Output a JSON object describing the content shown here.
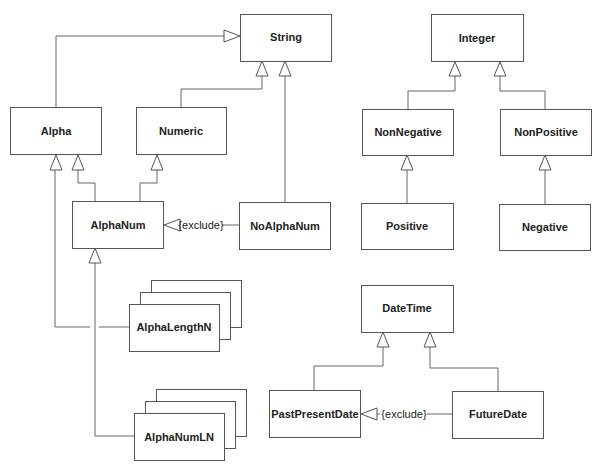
{
  "diagram": {
    "type": "UML class diagram (generalization hierarchy)",
    "classes": {
      "string": "String",
      "integer": "Integer",
      "alpha": "Alpha",
      "numeric": "Numeric",
      "nonnegative": "NonNegative",
      "nonpositive": "NonPositive",
      "alphanum": "AlphaNum",
      "noalphanum": "NoAlphaNum",
      "positive": "Positive",
      "negative": "Negative",
      "datetime": "DateTime",
      "alphalengthn": "AlphaLengthN",
      "pastpresentdate": "PastPresentDate",
      "futuredate": "FutureDate",
      "alphanumln": "AlphaNumLN"
    },
    "constraints": {
      "exclude1": "{exclude}",
      "exclude2": "{exclude}"
    },
    "relations": [
      {
        "from": "Alpha",
        "to": "String",
        "kind": "generalization"
      },
      {
        "from": "Numeric",
        "to": "String",
        "kind": "generalization"
      },
      {
        "from": "NoAlphaNum",
        "to": "String",
        "kind": "generalization"
      },
      {
        "from": "AlphaNum",
        "to": "Alpha",
        "kind": "generalization"
      },
      {
        "from": "AlphaNum",
        "to": "Numeric",
        "kind": "generalization"
      },
      {
        "from": "NoAlphaNum",
        "to": "AlphaNum",
        "kind": "exclude"
      },
      {
        "from": "AlphaLengthN",
        "to": "Alpha",
        "kind": "generalization"
      },
      {
        "from": "AlphaNumLN",
        "to": "AlphaNum",
        "kind": "generalization"
      },
      {
        "from": "NonNegative",
        "to": "Integer",
        "kind": "generalization"
      },
      {
        "from": "NonPositive",
        "to": "Integer",
        "kind": "generalization"
      },
      {
        "from": "Positive",
        "to": "NonNegative",
        "kind": "generalization"
      },
      {
        "from": "Negative",
        "to": "NonPositive",
        "kind": "generalization"
      },
      {
        "from": "PastPresentDate",
        "to": "DateTime",
        "kind": "generalization"
      },
      {
        "from": "FutureDate",
        "to": "DateTime",
        "kind": "generalization"
      },
      {
        "from": "FutureDate",
        "to": "PastPresentDate",
        "kind": "exclude"
      }
    ]
  }
}
